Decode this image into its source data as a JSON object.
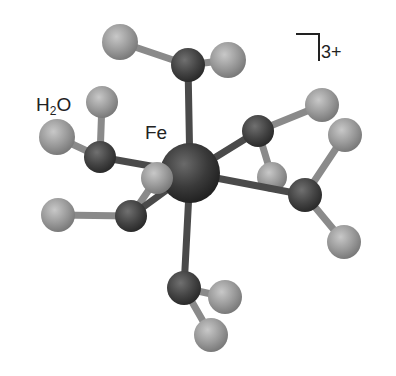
{
  "diagram": {
    "labels": {
      "metal": "Fe",
      "ligand_prefix": "H",
      "ligand_sub": "2",
      "ligand_suffix": "O",
      "charge": "3+"
    },
    "colors": {
      "fe": "#3a3a3a",
      "oxygen": "#444444",
      "hydrogen": "#9a9a9a",
      "bond_metal": "#4a4a4a",
      "bond_oh": "#8a8a8a",
      "background": "#ffffff"
    },
    "atoms": {
      "fe": {
        "x": 190,
        "y": 173,
        "r": 30
      },
      "oxygens": [
        {
          "name": "O-top",
          "x": 188,
          "y": 65,
          "r": 17
        },
        {
          "name": "O-left",
          "x": 100,
          "y": 157,
          "r": 16
        },
        {
          "name": "O-upper-right",
          "x": 258,
          "y": 131,
          "r": 16
        },
        {
          "name": "O-lower-left",
          "x": 131,
          "y": 216,
          "r": 16
        },
        {
          "name": "O-right",
          "x": 305,
          "y": 195,
          "r": 17
        },
        {
          "name": "O-bottom",
          "x": 184,
          "y": 288,
          "r": 17
        }
      ],
      "hydrogens": [
        {
          "x": 120,
          "y": 42
        },
        {
          "x": 228,
          "y": 60
        },
        {
          "x": 102,
          "y": 102
        },
        {
          "x": 57,
          "y": 137
        },
        {
          "x": 322,
          "y": 105
        },
        {
          "x": 345,
          "y": 135
        },
        {
          "x": 157,
          "y": 178
        },
        {
          "x": 272,
          "y": 177
        },
        {
          "x": 58,
          "y": 215
        },
        {
          "x": 344,
          "y": 242
        },
        {
          "x": 225,
          "y": 297
        },
        {
          "x": 211,
          "y": 335
        }
      ]
    }
  }
}
